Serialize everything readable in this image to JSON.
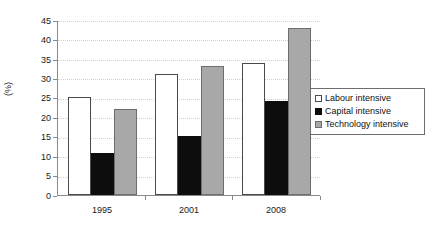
{
  "chart_data": {
    "type": "bar",
    "title": "",
    "xlabel": "",
    "ylabel": "(%)",
    "categories": [
      "1995",
      "2001",
      "2008"
    ],
    "series": [
      {
        "name": "Labour intensive",
        "values": [
          25.2,
          31.1,
          33.9
        ],
        "color": "#ffffff"
      },
      {
        "name": "Capital intensive",
        "values": [
          10.8,
          15.2,
          24.2
        ],
        "color": "#0d0d0d"
      },
      {
        "name": "Technology intensive",
        "values": [
          22.1,
          33.2,
          42.9
        ],
        "color": "#a8a8a8"
      }
    ],
    "ylim": [
      0,
      45
    ],
    "yticks": [
      0,
      5,
      10,
      15,
      20,
      25,
      30,
      35,
      40,
      45
    ],
    "ytick_labels": [
      "0",
      "5",
      "10",
      "15",
      "20",
      "25",
      "30",
      "35",
      "40",
      "45"
    ],
    "grid": true,
    "grid_axis": "y",
    "legend_position": "right"
  },
  "legend": {
    "items": [
      {
        "label": "Labour intensive"
      },
      {
        "label": "Capital intensive"
      },
      {
        "label": "Technology intensive"
      }
    ]
  }
}
